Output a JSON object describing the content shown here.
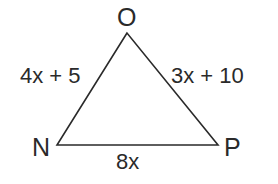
{
  "diagram": {
    "type": "triangle",
    "stroke_color": "#2a2a2a",
    "vertices": {
      "O": {
        "label": "O",
        "x": 127,
        "y": 33
      },
      "N": {
        "label": "N",
        "x": 57,
        "y": 145
      },
      "P": {
        "label": "P",
        "x": 218,
        "y": 145
      }
    },
    "sides": {
      "NO": {
        "label": "4x + 5"
      },
      "OP": {
        "label": "3x + 10"
      },
      "NP": {
        "label": "8x"
      }
    }
  }
}
